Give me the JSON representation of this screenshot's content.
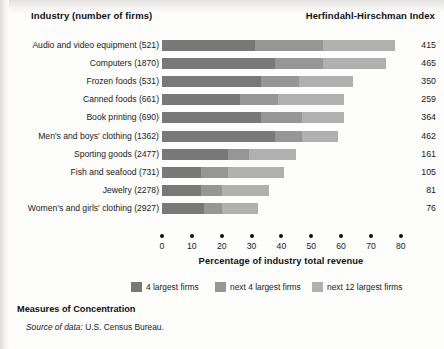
{
  "header": {
    "industry_label": "Industry (number of firms)",
    "hhi_label": "Herfindahl-Hirschman Index"
  },
  "footer": {
    "title": "Measures of Concentration",
    "source_prefix": "Source of data:",
    "source_text": " U.S. Census Bureau."
  },
  "legend": {
    "items": [
      {
        "label": "4 largest firms",
        "color": "#787878"
      },
      {
        "label": "next 4 largest firms",
        "color": "#969696"
      },
      {
        "label": "next 12 largest firms",
        "color": "#b0b0b0"
      }
    ]
  },
  "chart_data": {
    "type": "bar",
    "orientation": "horizontal",
    "stacked": true,
    "title": "",
    "xlabel": "Percentage of industry total revenue",
    "ylabel": "",
    "xlim": [
      0,
      80
    ],
    "xticks": [
      0,
      10,
      20,
      30,
      40,
      50,
      60,
      70,
      80
    ],
    "xtick_labels": [
      "0",
      "10",
      "20",
      "30",
      "40",
      "50",
      "60",
      "70",
      "80"
    ],
    "grid": false,
    "legend_position": "bottom",
    "categories": [
      "Audio and video equipment  (521)",
      "Computers  (1870)",
      "Frozen foods  (531)",
      "Canned foods  (661)",
      "Book printing  (690)",
      "Men's and boys' clothing  (1362)",
      "Sporting goods  (2477)",
      "Fish and seafood  (731)",
      "Jewelry  (2278)",
      "Women's and girls' clothing  (2927)"
    ],
    "series": [
      {
        "name": "4 largest firms",
        "values": [
          31,
          38,
          33,
          26,
          33,
          38,
          22,
          13,
          13,
          14
        ]
      },
      {
        "name": "next 4 largest firms",
        "values": [
          23,
          16,
          13,
          13,
          14,
          9,
          7,
          9,
          7,
          6
        ]
      },
      {
        "name": "next 12 largest firms",
        "values": [
          24,
          21,
          18,
          22,
          14,
          12,
          16,
          19,
          16,
          12
        ]
      }
    ],
    "totals": [
      78,
      75,
      64,
      61,
      61,
      59,
      45,
      41,
      36,
      32
    ],
    "hhi_column_header": "Herfindahl-Hirschman Index",
    "hhi_values": [
      415,
      465,
      350,
      259,
      364,
      462,
      161,
      105,
      81,
      76
    ],
    "firm_counts": [
      521,
      1870,
      531,
      661,
      690,
      1362,
      2477,
      731,
      2278,
      2927
    ]
  }
}
